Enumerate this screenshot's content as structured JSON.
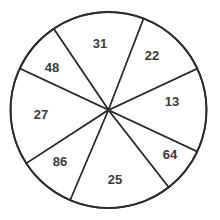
{
  "chart_data": {
    "type": "pie",
    "title": "",
    "xlabel": "",
    "ylabel": "",
    "grid": false,
    "legend": "none",
    "center": {
      "x": 108.5,
      "y": 110
    },
    "radius": 98,
    "stroke_color": "#2b2b2b",
    "fill_color": "#ffffff",
    "label_color": "#3a3a3a",
    "total": 294,
    "categories": [
      "31",
      "48",
      "27",
      "86",
      "25",
      "64",
      "13",
      "22"
    ],
    "values": [
      31,
      48,
      27,
      86,
      25,
      64,
      13,
      22
    ],
    "slices": [
      {
        "label": "31",
        "value": 31,
        "start_angle_deg": 69,
        "end_angle_deg": 124,
        "sweep_deg": 55,
        "label_x": 100,
        "label_y": 45
      },
      {
        "label": "48",
        "value": 48,
        "start_angle_deg": 124,
        "end_angle_deg": 155,
        "sweep_deg": 31,
        "label_x": 52,
        "label_y": 69
      },
      {
        "label": "27",
        "value": 27,
        "start_angle_deg": 155,
        "end_angle_deg": 213,
        "sweep_deg": 58,
        "label_x": 41,
        "label_y": 116
      },
      {
        "label": "86",
        "value": 86,
        "start_angle_deg": 213,
        "end_angle_deg": 247,
        "sweep_deg": 34,
        "label_x": 60,
        "label_y": 163
      },
      {
        "label": "25",
        "value": 25,
        "start_angle_deg": 247,
        "end_angle_deg": 308,
        "sweep_deg": 61,
        "label_x": 115,
        "label_y": 181
      },
      {
        "label": "64",
        "value": 64,
        "start_angle_deg": 308,
        "end_angle_deg": 335,
        "sweep_deg": 27,
        "label_x": 170,
        "label_y": 156
      },
      {
        "label": "13",
        "value": 13,
        "start_angle_deg": 335,
        "end_angle_deg": 25,
        "sweep_deg": 50,
        "label_x": 172,
        "label_y": 103
      },
      {
        "label": "22",
        "value": 22,
        "start_angle_deg": 25,
        "end_angle_deg": 69,
        "sweep_deg": 44,
        "label_x": 152,
        "label_y": 57
      }
    ]
  }
}
